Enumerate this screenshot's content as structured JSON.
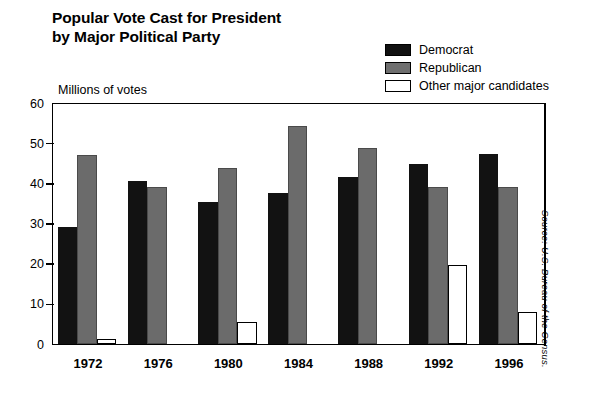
{
  "title": {
    "line1": "Popular Vote Cast for President",
    "line2": "by Major Political Party"
  },
  "axis_title": "Millions of votes",
  "source_note": "Source: U.S. Bureau of the Census.",
  "legend": {
    "items": [
      {
        "label": "Democrat",
        "color": "#121212",
        "swatch": "legend-swatch-democrat"
      },
      {
        "label": "Republican",
        "color": "#6b6b6b",
        "swatch": "legend-swatch-republican"
      },
      {
        "label": "Other major candidates",
        "color": "#ffffff",
        "swatch": "legend-swatch-other"
      }
    ]
  },
  "chart_data": {
    "type": "bar",
    "title": "Popular Vote Cast for President by Major Political Party",
    "xlabel": "",
    "ylabel": "Millions of votes",
    "ylim": [
      0,
      60
    ],
    "yticks": [
      0,
      10,
      20,
      30,
      40,
      50,
      60
    ],
    "ytick_labels": [
      "0",
      "10",
      "20",
      "30",
      "40",
      "50",
      "60"
    ],
    "grid": false,
    "legend_position": "top-right",
    "categories": [
      "1972",
      "1976",
      "1980",
      "1984",
      "1988",
      "1992",
      "1996"
    ],
    "series": [
      {
        "name": "Democrat",
        "color": "#121212",
        "values": [
          29.2,
          40.8,
          35.5,
          37.6,
          41.8,
          44.9,
          47.4
        ]
      },
      {
        "name": "Republican",
        "color": "#6b6b6b",
        "values": [
          47.2,
          39.1,
          43.9,
          54.5,
          48.9,
          39.1,
          39.2
        ]
      },
      {
        "name": "Other major candidates",
        "color": "#ffffff",
        "values": [
          1.4,
          0,
          5.7,
          0,
          0,
          19.7,
          8.1
        ]
      }
    ]
  }
}
